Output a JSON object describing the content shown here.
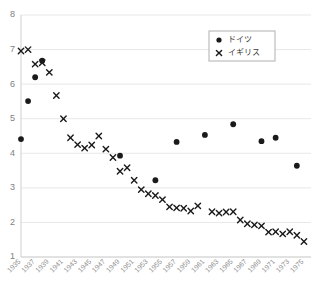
{
  "chart_data": {
    "type": "scatter",
    "title": "",
    "xlabel": "",
    "ylabel": "",
    "grid": true,
    "legend_position": "top-right",
    "ylim": [
      1,
      8
    ],
    "yticks": [
      1,
      2,
      3,
      4,
      5,
      6,
      7,
      8
    ],
    "xlim": [
      1935,
      1976
    ],
    "xticks": [
      1935,
      1937,
      1939,
      1941,
      1943,
      1945,
      1947,
      1949,
      1951,
      1953,
      1955,
      1957,
      1959,
      1961,
      1963,
      1965,
      1967,
      1969,
      1971,
      1973,
      1975
    ],
    "xtick_labels": [
      "1935",
      "1937",
      "1939",
      "1941",
      "1943",
      "1945",
      "1947",
      "1949",
      "1951",
      "1953",
      "1955",
      "1957",
      "1959",
      "1961",
      "1963",
      "1965",
      "1967",
      "1969",
      "1971",
      "1973",
      "1975"
    ],
    "series": [
      {
        "name": "ドイツ",
        "marker": "dot",
        "color": "#1a1a1a",
        "points": [
          {
            "x": 1935,
            "y": 4.41
          },
          {
            "x": 1936,
            "y": 5.51
          },
          {
            "x": 1937,
            "y": 6.2
          },
          {
            "x": 1938,
            "y": 6.68
          },
          {
            "x": 1949,
            "y": 3.93
          },
          {
            "x": 1954,
            "y": 3.22
          },
          {
            "x": 1957,
            "y": 4.33
          },
          {
            "x": 1961,
            "y": 4.53
          },
          {
            "x": 1965,
            "y": 4.84
          },
          {
            "x": 1969,
            "y": 4.35
          },
          {
            "x": 1971,
            "y": 4.45
          },
          {
            "x": 1974,
            "y": 3.64
          }
        ]
      },
      {
        "name": "イギリス",
        "marker": "x",
        "color": "#1a1a1a",
        "points": [
          {
            "x": 1935,
            "y": 6.96
          },
          {
            "x": 1936,
            "y": 7.0
          },
          {
            "x": 1937,
            "y": 6.58
          },
          {
            "x": 1938,
            "y": 6.62
          },
          {
            "x": 1939,
            "y": 6.34
          },
          {
            "x": 1940,
            "y": 5.67
          },
          {
            "x": 1941,
            "y": 5.0
          },
          {
            "x": 1942,
            "y": 4.45
          },
          {
            "x": 1943,
            "y": 4.25
          },
          {
            "x": 1944,
            "y": 4.15
          },
          {
            "x": 1945,
            "y": 4.24
          },
          {
            "x": 1946,
            "y": 4.5
          },
          {
            "x": 1947,
            "y": 4.12
          },
          {
            "x": 1948,
            "y": 3.88
          },
          {
            "x": 1949,
            "y": 3.48
          },
          {
            "x": 1950,
            "y": 3.58
          },
          {
            "x": 1951,
            "y": 3.22
          },
          {
            "x": 1952,
            "y": 2.95
          },
          {
            "x": 1953,
            "y": 2.83
          },
          {
            "x": 1954,
            "y": 2.78
          },
          {
            "x": 1955,
            "y": 2.66
          },
          {
            "x": 1956,
            "y": 2.45
          },
          {
            "x": 1957,
            "y": 2.42
          },
          {
            "x": 1958,
            "y": 2.41
          },
          {
            "x": 1959,
            "y": 2.33
          },
          {
            "x": 1960,
            "y": 2.48
          },
          {
            "x": 1962,
            "y": 2.31
          },
          {
            "x": 1963,
            "y": 2.27
          },
          {
            "x": 1964,
            "y": 2.3
          },
          {
            "x": 1965,
            "y": 2.31
          },
          {
            "x": 1966,
            "y": 2.07
          },
          {
            "x": 1967,
            "y": 1.96
          },
          {
            "x": 1968,
            "y": 1.93
          },
          {
            "x": 1969,
            "y": 1.9
          },
          {
            "x": 1970,
            "y": 1.72
          },
          {
            "x": 1971,
            "y": 1.73
          },
          {
            "x": 1972,
            "y": 1.67
          },
          {
            "x": 1973,
            "y": 1.73
          },
          {
            "x": 1974,
            "y": 1.63
          },
          {
            "x": 1975,
            "y": 1.45
          }
        ]
      }
    ]
  },
  "legend": {
    "entries": [
      {
        "label": "ドイツ",
        "marker": "dot"
      },
      {
        "label": "イギリス",
        "marker": "x"
      }
    ]
  }
}
